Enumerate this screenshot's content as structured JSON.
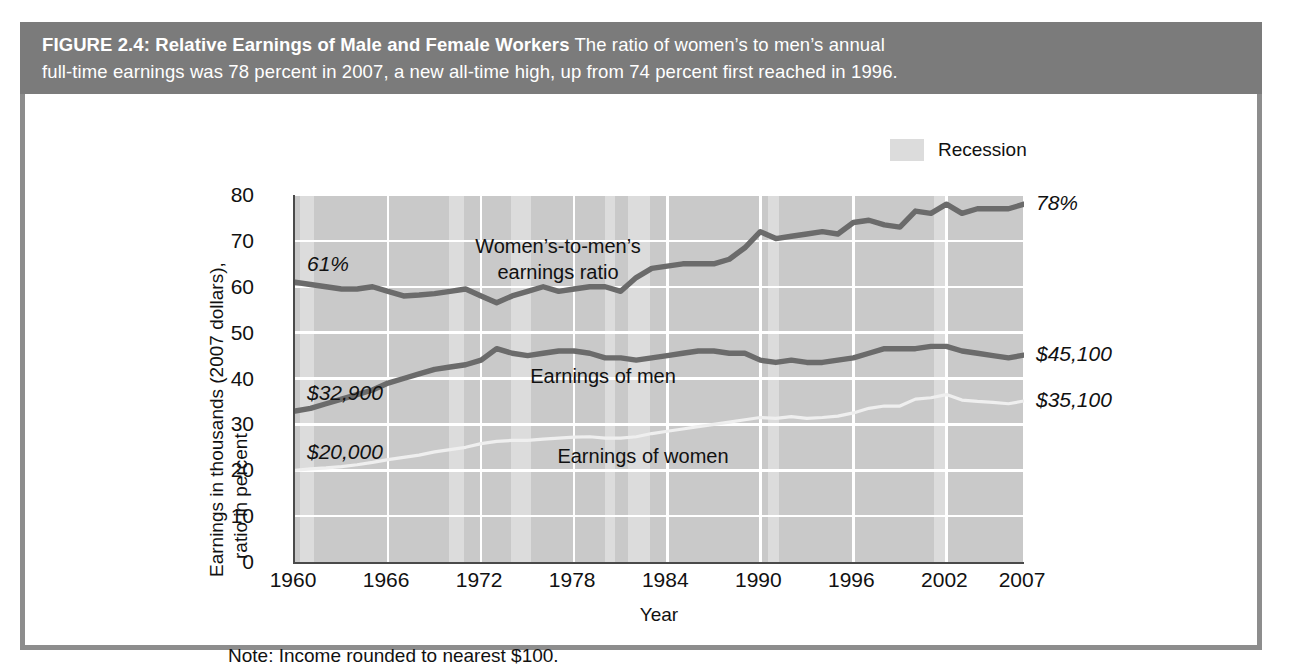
{
  "figure": {
    "label": "FIGURE 2.4:",
    "title": "Relative Earnings of Male and Female Workers",
    "caption_line1": "The ratio of women’s to men’s annual",
    "caption_line2": "full-time earnings was 78 percent in 2007, a new all-time high, up from 74 percent first reached in 1996.",
    "note": "Note: Income rounded to nearest $100.",
    "header_color": "#7b7b7b",
    "border_color": "#8d8d8d"
  },
  "legend": {
    "items": [
      {
        "label": "Recession",
        "color": "#dcdcdc"
      }
    ]
  },
  "chart_data": {
    "type": "line",
    "title": "Relative Earnings of Male and Female Workers",
    "xlabel": "Year",
    "ylabel_line1": "Earnings in thousands (2007 dollars),",
    "ylabel_line2": "ratio in percent",
    "plot_background": "#c9c9c9",
    "grid": "white horizontal and vertical gridlines",
    "legend_position": "top-right",
    "xlim": [
      1960,
      2007
    ],
    "ylim": [
      0,
      80
    ],
    "yticks": [
      0,
      10,
      20,
      30,
      40,
      50,
      60,
      70,
      80
    ],
    "xticks": [
      1960,
      1966,
      1972,
      1978,
      1984,
      1990,
      1996,
      2002,
      2007
    ],
    "xtick_labels": [
      "1960",
      "1966",
      "1972",
      "1978",
      "1984",
      "1990",
      "1996",
      "2002",
      "2007"
    ],
    "ytick_labels": [
      "0",
      "10",
      "20",
      "30",
      "40",
      "50",
      "60",
      "70",
      "80"
    ],
    "x": [
      1960,
      1961,
      1962,
      1963,
      1964,
      1965,
      1966,
      1967,
      1968,
      1969,
      1970,
      1971,
      1972,
      1973,
      1974,
      1975,
      1976,
      1977,
      1978,
      1979,
      1980,
      1981,
      1982,
      1983,
      1984,
      1985,
      1986,
      1987,
      1988,
      1989,
      1990,
      1991,
      1992,
      1993,
      1994,
      1995,
      1996,
      1997,
      1998,
      1999,
      2000,
      2001,
      2002,
      2003,
      2004,
      2005,
      2006,
      2007
    ],
    "series": [
      {
        "name": "Women’s-to-men’s earnings ratio",
        "label_in_plot": "Women’s-to-men’s earnings ratio",
        "units": "percent",
        "color": "#6b6b6b",
        "start_annotation": "61%",
        "end_annotation": "78%",
        "values": [
          61,
          60.5,
          60,
          59.5,
          59.5,
          60,
          59,
          58,
          58.2,
          58.5,
          59,
          59.5,
          58,
          56.5,
          58,
          59,
          60,
          59,
          59.5,
          60,
          60,
          59,
          62,
          64,
          64.5,
          65,
          65,
          65,
          66,
          68.5,
          72,
          70.5,
          71,
          71.5,
          72,
          71.5,
          74,
          74.5,
          73.5,
          73,
          76.5,
          76,
          78,
          76,
          77,
          77,
          77,
          78
        ]
      },
      {
        "name": "Earnings of men",
        "label_in_plot": "Earnings of men",
        "units": "thousands of 2007 dollars",
        "color": "#6b6b6b",
        "start_annotation": "$32,900",
        "end_annotation": "$45,100",
        "values": [
          32.9,
          33.5,
          34.5,
          35.5,
          36.5,
          37.5,
          39,
          40,
          41,
          42,
          42.5,
          43,
          44,
          46.5,
          45.5,
          45,
          45.5,
          46,
          46,
          45.5,
          44.5,
          44.5,
          44,
          44.5,
          45,
          45.5,
          46,
          46,
          45.5,
          45.5,
          44,
          43.5,
          44,
          43.5,
          43.5,
          44,
          44.5,
          45.5,
          46.5,
          46.5,
          46.5,
          47,
          47,
          46,
          45.5,
          45,
          44.5,
          45.1
        ]
      },
      {
        "name": "Earnings of women",
        "label_in_plot": "Earnings of women",
        "units": "thousands of 2007 dollars",
        "color": "#efefef",
        "start_annotation": "$20,000",
        "end_annotation": "$35,100",
        "values": [
          20,
          20.3,
          20.5,
          20.8,
          21.2,
          21.7,
          22.3,
          22.8,
          23.3,
          24,
          24.5,
          25,
          25.8,
          26.3,
          26.5,
          26.5,
          26.8,
          27,
          27.2,
          27.3,
          27,
          27,
          27.3,
          28,
          28.5,
          29,
          29.5,
          30,
          30.5,
          31,
          31.5,
          31.3,
          31.7,
          31.3,
          31.5,
          31.8,
          32.5,
          33.5,
          34,
          34,
          35.5,
          35.8,
          36.5,
          35.3,
          35,
          34.8,
          34.5,
          35.1
        ]
      }
    ],
    "recessions": [
      {
        "start": 1960.3,
        "end": 1961.2
      },
      {
        "start": 1969.9,
        "end": 1970.9
      },
      {
        "start": 1973.9,
        "end": 1975.2
      },
      {
        "start": 1980.0,
        "end": 1980.6
      },
      {
        "start": 1981.5,
        "end": 1982.9
      },
      {
        "start": 1990.5,
        "end": 1991.2
      },
      {
        "start": 2001.2,
        "end": 2001.9
      }
    ],
    "annotations": [
      {
        "text": "61%",
        "series": "Women’s-to-men’s earnings ratio",
        "side": "left",
        "value": 61
      },
      {
        "text": "78%",
        "series": "Women’s-to-men’s earnings ratio",
        "side": "right",
        "value": 78
      },
      {
        "text": "$32,900",
        "series": "Earnings of men",
        "side": "left",
        "value": 32.9
      },
      {
        "text": "$45,100",
        "series": "Earnings of men",
        "side": "right",
        "value": 45.1
      },
      {
        "text": "$20,000",
        "series": "Earnings of women",
        "side": "left",
        "value": 20.0
      },
      {
        "text": "$35,100",
        "series": "Earnings of women",
        "side": "right",
        "value": 35.1
      }
    ]
  }
}
